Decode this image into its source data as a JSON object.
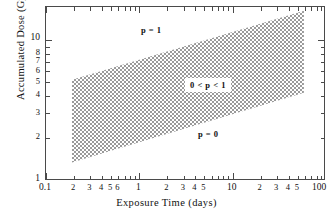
{
  "chart_data": {
    "type": "area",
    "title": "",
    "xlabel": "Exposure Time (days)",
    "ylabel": "Accumulated Dose (Gy)",
    "xscale": "log",
    "yscale": "log",
    "xlim": [
      0.1,
      100
    ],
    "ylim": [
      1,
      17
    ],
    "grid": false,
    "legend_position": "none",
    "x_major_ticks": [
      "0.1",
      "1",
      "10",
      "100"
    ],
    "x_minor_ticks_decade1": [
      "2",
      "3",
      "4",
      "5",
      "6"
    ],
    "x_minor_ticks_decade2": [
      "2",
      "3",
      "4",
      "5"
    ],
    "x_minor_ticks_decade3": [
      "2",
      "3",
      "4",
      "5"
    ],
    "x_tick_labels": [
      "0.1",
      "2",
      "3",
      "4",
      "5",
      "6",
      "1",
      "2",
      "3",
      "4",
      "5",
      "10",
      "2",
      "3",
      "4",
      "5",
      "100"
    ],
    "y_tick_labels": [
      "1",
      "2",
      "3",
      "4",
      "5",
      "6",
      "7",
      "8",
      "10"
    ],
    "series": [
      {
        "name": "upper-boundary",
        "description": "p = 1 threshold (upper edge of shaded band)",
        "x": [
          0.19,
          58
        ],
        "y": [
          5.2,
          16.0
        ]
      },
      {
        "name": "lower-boundary",
        "description": "p = 0 threshold (lower edge of shaded band)",
        "x": [
          0.19,
          58
        ],
        "y": [
          1.35,
          4.2
        ]
      }
    ],
    "shaded_region": {
      "label": "0 < p < 1",
      "fill": "checkerboard-hatch",
      "fill_color": "#9a9a9a",
      "x_start": 0.19,
      "x_end": 58
    },
    "annotations": [
      {
        "name": "p-equals-one",
        "text": "p = 1",
        "x": 0.62,
        "y": 11.6
      },
      {
        "name": "p-range",
        "text": "0 < p < 1",
        "x": 3.6,
        "y": 5.6,
        "boxed": true
      },
      {
        "name": "p-equals-zero",
        "text": "p = 0",
        "x": 6.3,
        "y": 2.35
      }
    ]
  },
  "axes": {
    "x_title": "Exposure Time (days)",
    "y_title": "Accumulated Dose (Gy)"
  },
  "colors": {
    "frame": "#4a4a4a",
    "text": "#111111",
    "hatch": "#9a9a9a",
    "background": "#ffffff"
  }
}
